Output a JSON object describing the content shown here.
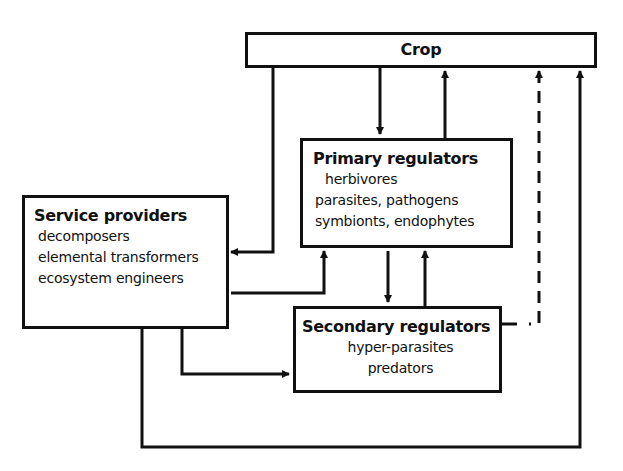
{
  "diagram": {
    "crop": {
      "title": "Crop"
    },
    "primary_regulators": {
      "title": "Primary regulators",
      "items": [
        "herbivores",
        "parasites, pathogens",
        "symbionts, endophytes"
      ]
    },
    "service_providers": {
      "title": "Service providers",
      "items": [
        "decomposers",
        "elemental transformers",
        "ecosystem engineers"
      ]
    },
    "secondary_regulators": {
      "title": "Secondary regulators",
      "items": [
        "hyper-parasites",
        "predators"
      ]
    },
    "edges": [
      {
        "from": "Crop",
        "to": "Service providers",
        "style": "solid"
      },
      {
        "from": "Crop",
        "to": "Primary regulators",
        "style": "solid"
      },
      {
        "from": "Primary regulators",
        "to": "Crop",
        "style": "solid"
      },
      {
        "from": "Service providers",
        "to": "Primary regulators",
        "style": "solid"
      },
      {
        "from": "Primary regulators",
        "to": "Secondary regulators",
        "style": "solid"
      },
      {
        "from": "Secondary regulators",
        "to": "Primary regulators",
        "style": "solid"
      },
      {
        "from": "Service providers",
        "to": "Secondary regulators",
        "style": "solid"
      },
      {
        "from": "Secondary regulators",
        "to": "Crop",
        "style": "dashed"
      },
      {
        "from": "Service providers",
        "to": "Crop",
        "style": "solid"
      }
    ],
    "colors": {
      "line": "#111111",
      "background": "#ffffff"
    }
  }
}
